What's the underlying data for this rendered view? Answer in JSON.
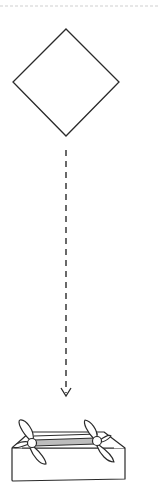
{
  "diagram": {
    "type": "instruction-step",
    "colors": {
      "stroke": "#2a2a2a",
      "background": "#ffffff",
      "separator": "#cfcfcf",
      "inner_band": "#bdbdbd"
    },
    "elements": {
      "separator": {
        "style": "dashed",
        "y": 6
      },
      "diamond": {
        "shape": "square-rotated-45",
        "points": {
          "top": [
            66,
            29
          ],
          "right": [
            119,
            82
          ],
          "bottom": [
            66,
            136
          ],
          "left": [
            13,
            82
          ]
        }
      },
      "arrow": {
        "style": "dashed",
        "direction": "down",
        "from": [
          66,
          150
        ],
        "to": [
          66,
          395
        ]
      },
      "result": {
        "shape": "open-box-with-pinwheels",
        "pinwheel_count": 2
      }
    }
  }
}
